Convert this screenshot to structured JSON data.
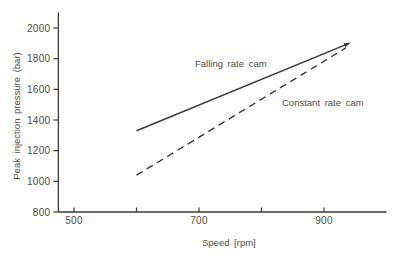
{
  "chart_data": {
    "type": "line",
    "title": "",
    "xlabel": "Speed [rpm]",
    "ylabel": "Peak injection pressure (bar)",
    "xlim": [
      475,
      1000
    ],
    "ylim": [
      800,
      2100
    ],
    "grid": false,
    "x_ticks": [
      500,
      600,
      700,
      800,
      900
    ],
    "x_tick_labels": [
      "500",
      "",
      "700",
      "",
      "900"
    ],
    "y_ticks": [
      800,
      1000,
      1200,
      1400,
      1600,
      1800,
      2000
    ],
    "y_tick_labels": [
      "800",
      "1000",
      "1200",
      "1400",
      "1600",
      "1800",
      "2000"
    ],
    "legend_position": "inline-annotations",
    "series": [
      {
        "name": "Falling rate cam",
        "line_style": "solid",
        "arrowhead_at_end": true,
        "points": [
          [
            600,
            1330
          ],
          [
            940,
            1900
          ]
        ]
      },
      {
        "name": "Constant rate cam",
        "line_style": "dashed",
        "arrowhead_at_end": false,
        "points": [
          [
            600,
            1040
          ],
          [
            935,
            1870
          ]
        ]
      }
    ],
    "annotations": [
      {
        "text": "Falling rate cam",
        "x": 750,
        "y": 1780
      },
      {
        "text": "Constant rate cam",
        "x": 900,
        "y": 1520
      }
    ]
  },
  "colors": {
    "axis": "#3a3a3a",
    "line": "#3a3a3a",
    "text": "#4d4d4d",
    "background": "#fdfdfc"
  }
}
